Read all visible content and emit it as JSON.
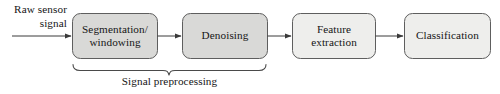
{
  "diagram": {
    "source_label": {
      "line1": "Raw sensor",
      "line2": "signal"
    },
    "group_label": "Signal preprocessing",
    "colors": {
      "preprocessing_fill": "#d9d9d7",
      "downstream_fill": "#eeeeec",
      "node_stroke": "#5e5e5e",
      "arrow": "#3a3a3a",
      "text": "#151515",
      "brace": "#4a4a4a",
      "background": "#ffffff"
    },
    "nodes": [
      {
        "id": "segmentation-windowing",
        "label_line1": "Segmentation/",
        "label_line2": "windowing",
        "group": "preprocessing"
      },
      {
        "id": "denoising",
        "label_line1": "Denoising",
        "label_line2": "",
        "group": "preprocessing"
      },
      {
        "id": "feature-extraction",
        "label_line1": "Feature",
        "label_line2": "extraction",
        "group": "downstream"
      },
      {
        "id": "classification",
        "label_line1": "Classification",
        "label_line2": "",
        "group": "downstream"
      }
    ],
    "edges": [
      {
        "id": "input-to-segmentation",
        "from": "raw-sensor-signal",
        "to": "segmentation-windowing"
      },
      {
        "id": "segmentation-to-denoising",
        "from": "segmentation-windowing",
        "to": "denoising"
      },
      {
        "id": "denoising-to-feature-extraction",
        "from": "denoising",
        "to": "feature-extraction"
      },
      {
        "id": "feature-extraction-to-classification",
        "from": "feature-extraction",
        "to": "classification"
      }
    ]
  }
}
